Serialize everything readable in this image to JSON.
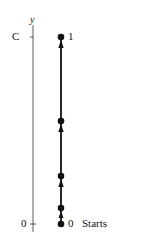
{
  "diagram": {
    "axis": {
      "label": "y",
      "top_tick_label": "C",
      "bottom_tick_label": "0"
    },
    "nodes": [
      {
        "label": "1",
        "y": 37
      },
      {
        "label": "",
        "y": 121
      },
      {
        "label": "",
        "y": 176
      },
      {
        "label": "",
        "y": 208
      },
      {
        "label": "0",
        "y": 224
      }
    ],
    "start_label": "Starts",
    "top_node_label": "1",
    "bottom_node_label": "0",
    "colors": {
      "line": "#111111",
      "background": "#ffffff"
    }
  }
}
